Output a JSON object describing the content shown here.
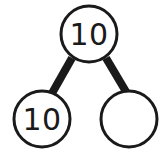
{
  "diagram": {
    "type": "number-bond",
    "background_color": "#ffffff",
    "stroke_color": "#1a1a1a",
    "connector_color": "#1a1a1a",
    "nodes": {
      "whole": {
        "label": "10",
        "position": "top",
        "filled": false
      },
      "part_left": {
        "label": "10",
        "position": "bottom-left",
        "filled": false
      },
      "part_right": {
        "label": "",
        "position": "bottom-right",
        "filled": false
      }
    },
    "connectors": [
      {
        "from": "whole",
        "to": "part_left"
      },
      {
        "from": "whole",
        "to": "part_right"
      }
    ]
  }
}
